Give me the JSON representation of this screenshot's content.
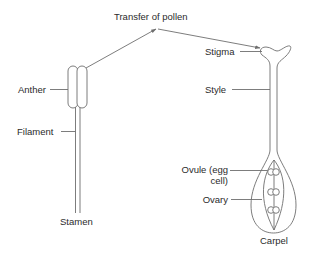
{
  "diagram": {
    "transfer_label": "Transfer of pollen",
    "stamen": {
      "name": "Stamen",
      "parts": {
        "anther": "Anther",
        "filament": "Filament"
      }
    },
    "carpel": {
      "name": "Carpel",
      "parts": {
        "stigma": "Stigma",
        "style": "Style",
        "ovule_line1": "Ovule (egg",
        "ovule_line2": "cell)",
        "ovary": "Ovary"
      }
    },
    "colors": {
      "line": "#6e6e6e",
      "text": "#2b2b2b",
      "background": "#ffffff"
    }
  }
}
